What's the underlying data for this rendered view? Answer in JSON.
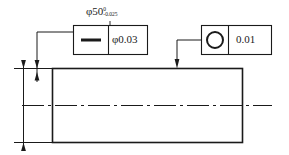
{
  "drawing": {
    "title": "Shaft geometric tolerance drawing",
    "stroke_color": "#1a1a1a",
    "background": "#ffffff"
  },
  "dimension": {
    "name": "diameter-dimension",
    "symbol": "φ50",
    "nominal": "φ50",
    "upper_tolerance": "0",
    "lower_tolerance": "-0.025"
  },
  "feature_control_frames": [
    {
      "name": "straightness-frame",
      "symbol": "straightness-icon",
      "symbol_glyph": "—",
      "value": "φ0.03"
    },
    {
      "name": "circularity-frame",
      "symbol": "circularity-icon",
      "symbol_glyph": "○",
      "value": "0.01"
    }
  ],
  "part": {
    "name": "shaft-body",
    "shape": "rectangle",
    "centerline": "dash-dot"
  },
  "leaders": [
    {
      "name": "straightness-leader",
      "target": "top-edge-left"
    },
    {
      "name": "circularity-leader",
      "target": "top-edge-right"
    }
  ]
}
